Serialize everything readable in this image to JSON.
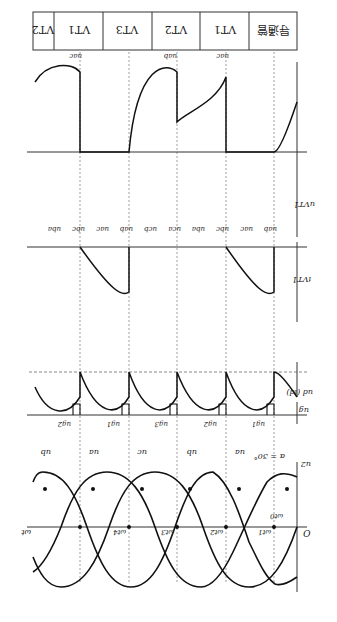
{
  "figure": {
    "orientation": "rotated-180",
    "alpha_label": "α = 30°",
    "origin_label": "O",
    "axis_label": "ωt"
  },
  "header_row": {
    "title": "导通管",
    "cells": [
      "VT1",
      "VT2",
      "VT3",
      "VT1",
      "VT2"
    ]
  },
  "panels": {
    "supply": {
      "ylabel": "u2",
      "phase_labels": [
        "ua",
        "ub",
        "uc",
        "ua",
        "ub",
        "uc"
      ],
      "time_marks": [
        "ωt0",
        "ωt1",
        "ωt2",
        "ωt3",
        "ωt4"
      ]
    },
    "gate_pulses": {
      "ylabel": "ug",
      "pulse_labels": [
        "ug1",
        "ug2",
        "ug3",
        "ug1",
        "ug2"
      ]
    },
    "output": {
      "ylabel": "ud (id)"
    },
    "thyristor_current": {
      "ylabel": "iVT1"
    },
    "thyristor_voltage": {
      "ylabel": "uVT1",
      "line_labels": [
        "uab",
        "uac",
        "ubc",
        "uba",
        "uca",
        "ucb",
        "uab",
        "uac",
        "ubc",
        "uba"
      ],
      "top_labels": [
        "uac",
        "uab",
        "uac"
      ]
    }
  }
}
